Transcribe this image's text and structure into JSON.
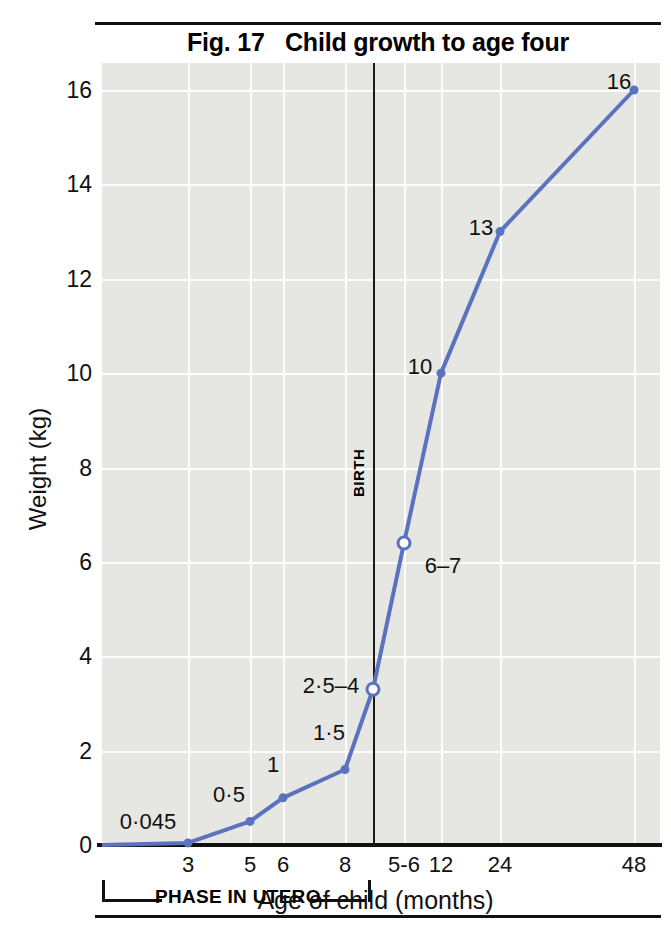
{
  "figure": {
    "title": "Fig. 17   Child growth to age four",
    "birth_marker_label": "BIRTH",
    "utero_bracket_label": "PHASE IN UTERO"
  },
  "colors": {
    "series_line": "#5b73bf",
    "plot_background": "#e6e6e2",
    "gridline": "#fdfdfb",
    "axis": "#111111",
    "text": "#111111"
  },
  "chart_data": {
    "type": "line",
    "title": "Fig. 17   Child growth to age four",
    "xlabel": "Age of child (months)",
    "ylabel": "Weight (kg)",
    "grid": true,
    "legend": "none",
    "ylim": [
      0,
      17
    ],
    "yticks": [
      0,
      2,
      4,
      6,
      8,
      10,
      12,
      14,
      16
    ],
    "ytick_labels": [
      "0",
      "2",
      "4",
      "6",
      "8",
      "10",
      "12",
      "14",
      "16"
    ],
    "xtick_labels": [
      "3",
      "5",
      "6",
      "8",
      "5-6",
      "12",
      "24",
      "48"
    ],
    "annotations": [
      {
        "text": "BIRTH",
        "note": "vertical reference line between in-utero and post-birth phases"
      },
      {
        "text": "PHASE IN UTERO",
        "note": "bracket spanning x ticks 3 through 8"
      }
    ],
    "points": [
      {
        "x_label": "3",
        "x_px": 188,
        "value": 0.045,
        "data_label": "0·045",
        "marker": "filled",
        "label_x": 148,
        "label_y": 822
      },
      {
        "x_label": "5",
        "x_px": 250,
        "value": 0.5,
        "data_label": "0·5",
        "marker": "filled",
        "label_x": 229,
        "label_y": 795
      },
      {
        "x_label": "6",
        "x_px": 283,
        "value": 1.0,
        "data_label": "1",
        "marker": "filled",
        "label_x": 273,
        "label_y": 765
      },
      {
        "x_label": "8",
        "x_px": 345,
        "value": 1.6,
        "data_label": "1·5",
        "marker": "filled",
        "label_x": 329,
        "label_y": 733
      },
      {
        "x_label": "birth",
        "x_px": 373,
        "value": 3.3,
        "data_label": "2·5–4",
        "marker": "open",
        "label_x": 331,
        "label_y": 686
      },
      {
        "x_label": "5-6",
        "x_px": 404,
        "value": 6.4,
        "data_label": "6–7",
        "marker": "open",
        "label_x": 443,
        "label_y": 566
      },
      {
        "x_label": "12",
        "x_px": 441,
        "value": 10.0,
        "data_label": "10",
        "marker": "filled",
        "label_x": 420,
        "label_y": 367
      },
      {
        "x_label": "24",
        "x_px": 500,
        "value": 13.0,
        "data_label": "13",
        "marker": "filled",
        "label_x": 481,
        "label_y": 228
      },
      {
        "x_label": "48",
        "x_px": 634,
        "value": 16.0,
        "data_label": "16",
        "marker": "filled",
        "label_x": 619,
        "label_y": 82
      }
    ]
  }
}
